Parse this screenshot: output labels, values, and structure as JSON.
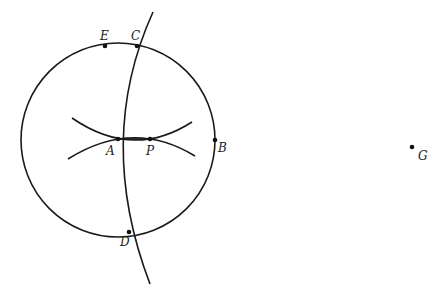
{
  "diagram": {
    "type": "geometric-construction",
    "colors": {
      "stroke": "#1a1a1a",
      "point": "#111111",
      "label": "#222222",
      "background": "#ffffff"
    },
    "circle": {
      "cx": 118,
      "cy": 140,
      "r": 97
    },
    "points": [
      {
        "id": "E",
        "label": "E",
        "x": 105,
        "y": 46
      },
      {
        "id": "C",
        "label": "C",
        "x": 137,
        "y": 46
      },
      {
        "id": "A",
        "label": "A",
        "x": 118,
        "y": 139
      },
      {
        "id": "P",
        "label": "P",
        "x": 150,
        "y": 139
      },
      {
        "id": "B",
        "label": "B",
        "x": 215,
        "y": 140
      },
      {
        "id": "D",
        "label": "D",
        "x": 129,
        "y": 232
      },
      {
        "id": "G",
        "label": "G",
        "x": 412,
        "y": 147
      }
    ],
    "curves": [
      {
        "id": "arc-CD",
        "description": "long arc through C and D extending beyond circle"
      },
      {
        "id": "arc-upper-x",
        "description": "upper crossing arc near A-P"
      },
      {
        "id": "arc-lower-x",
        "description": "lower crossing arc near A-P"
      },
      {
        "id": "segment-AP",
        "description": "segment from A to P"
      }
    ]
  }
}
